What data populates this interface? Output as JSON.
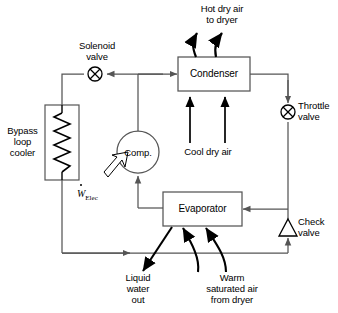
{
  "diagram": {
    "stroke_color": "#555555",
    "text_color": "#000000",
    "components": {
      "condenser": {
        "label": "Condenser"
      },
      "evaporator": {
        "label": "Evaporator"
      },
      "compressor": {
        "label": "Comp."
      },
      "bypass_cooler": {
        "label": "Bypass\nloop\ncooler"
      },
      "solenoid_valve": {
        "label": "Solenoid\nvalve"
      },
      "throttle_valve": {
        "label": "Throttle\nvalve"
      },
      "check_valve": {
        "label": "Check\nvalve"
      }
    },
    "flow_labels": {
      "hot_dry_air": "Hot dry air\nto dryer",
      "cool_dry_air": "Cool dry air",
      "liquid_water": "Liquid\nwater\nout",
      "warm_saturated_air": "Warm\nsaturated air\nfrom dryer"
    },
    "work_input": {
      "symbol": "W",
      "subscript": "Elec"
    }
  }
}
